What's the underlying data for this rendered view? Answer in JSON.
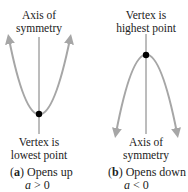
{
  "panel_a": {
    "top_label_line1": "Axis of",
    "top_label_line2": "symmetry",
    "bottom_label_line1": "Vertex is",
    "bottom_label_line2": "lowest point",
    "caption_letter": "a",
    "caption_text": "Opens up",
    "condition_var": "a",
    "condition_rest": " > 0",
    "direction": "up"
  },
  "panel_b": {
    "top_label_line1": "Vertex is",
    "top_label_line2": "highest point",
    "bottom_label_line1": "Axis of",
    "bottom_label_line2": "symmetry",
    "caption_letter": "b",
    "caption_text": "Opens down",
    "condition_var": "a",
    "condition_rest": " < 0",
    "direction": "down"
  },
  "colors": {
    "curve": "#a6a6a6",
    "axis": "#7a7a7a",
    "vertex": "#000000",
    "text": "#222222"
  }
}
